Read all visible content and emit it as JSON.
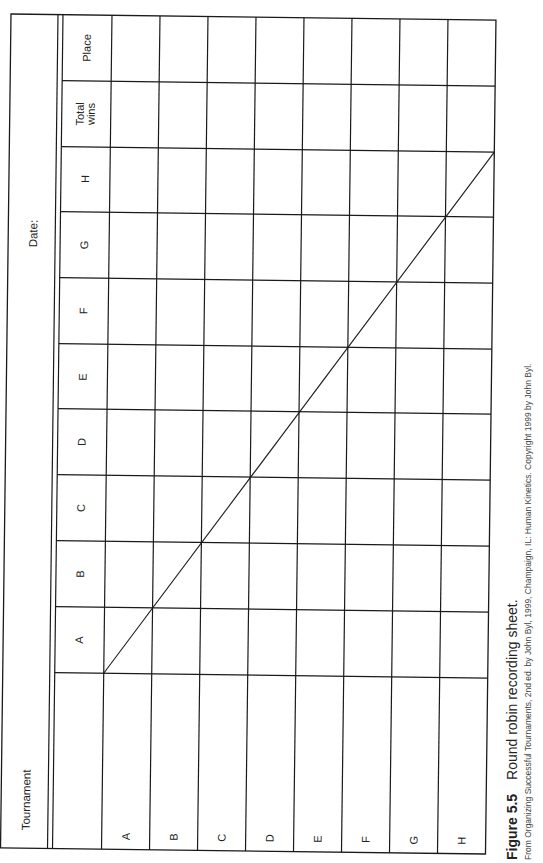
{
  "sheet": {
    "title_label": "Tournament",
    "date_label": "Date:",
    "column_headers": [
      "A",
      "B",
      "C",
      "D",
      "E",
      "F",
      "G",
      "H",
      "Total wins",
      "Place"
    ],
    "total_wins_line1": "Total",
    "total_wins_line2": "wins",
    "place_label": "Place",
    "row_labels": [
      "A",
      "B",
      "C",
      "D",
      "E",
      "F",
      "G",
      "H"
    ],
    "diagonal": "self-match cells crossed out from A-A to H-H",
    "cells": [
      [
        "",
        "",
        "",
        "",
        "",
        "",
        "",
        "",
        "",
        ""
      ],
      [
        "",
        "",
        "",
        "",
        "",
        "",
        "",
        "",
        "",
        ""
      ],
      [
        "",
        "",
        "",
        "",
        "",
        "",
        "",
        "",
        "",
        ""
      ],
      [
        "",
        "",
        "",
        "",
        "",
        "",
        "",
        "",
        "",
        ""
      ],
      [
        "",
        "",
        "",
        "",
        "",
        "",
        "",
        "",
        "",
        ""
      ],
      [
        "",
        "",
        "",
        "",
        "",
        "",
        "",
        "",
        "",
        ""
      ],
      [
        "",
        "",
        "",
        "",
        "",
        "",
        "",
        "",
        "",
        ""
      ],
      [
        "",
        "",
        "",
        "",
        "",
        "",
        "",
        "",
        "",
        ""
      ]
    ],
    "line_color": "#1a1a1a"
  },
  "caption": {
    "figure_number": "Figure 5.5",
    "figure_title": "Round robin recording sheet.",
    "source": "From Organizing Successful Tournaments, 2nd ed. by John Byl, 1999, Champaign, IL: Human Kinetics. Copyright 1999 by John Byl."
  }
}
